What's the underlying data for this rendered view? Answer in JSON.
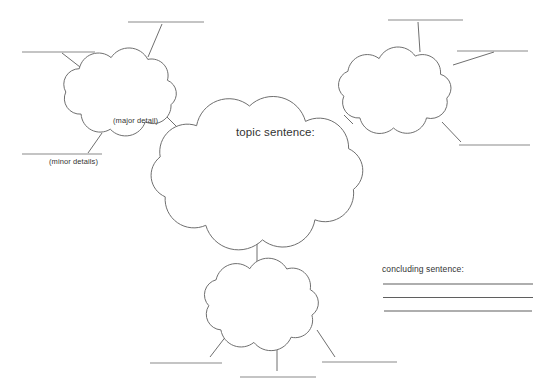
{
  "worksheet": {
    "topic_cloud_label": "topic sentence:",
    "major_detail_label": "(major detail)",
    "minor_details_label": "(minor details)",
    "concluding_label": "concluding sentence:"
  },
  "colors": {
    "background": "#ffffff",
    "outline": "#6f6f6f",
    "blank_line": "#8a8a8a",
    "concluding_line": "#5f5f5f",
    "text": "#333333"
  }
}
